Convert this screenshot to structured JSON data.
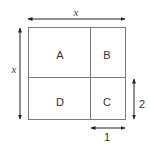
{
  "diagram": {
    "regions": [
      {
        "id": "A",
        "label": "A"
      },
      {
        "id": "B",
        "label": "B"
      },
      {
        "id": "C",
        "label": "C"
      },
      {
        "id": "D",
        "label": "D"
      }
    ],
    "dimensions": {
      "top_width": "x",
      "left_height": "x",
      "right_segment_height": "2",
      "bottom_segment_width": "1"
    },
    "colors": {
      "stroke": "#7a7a7a",
      "arrow": "#222222",
      "text": "#333333"
    }
  }
}
